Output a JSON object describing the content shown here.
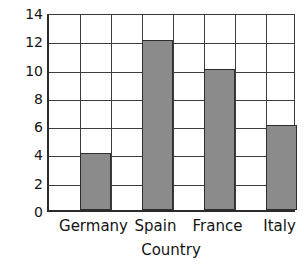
{
  "chart_data": {
    "type": "bar",
    "title": "",
    "categories": [
      "Germany",
      "Spain",
      "France",
      "Italy"
    ],
    "values": [
      4,
      12,
      10,
      6
    ],
    "xlabel": "Country",
    "ylabel": "Number of adults",
    "ylim": [
      0,
      14
    ],
    "ytick_labels": [
      "0",
      "2",
      "4",
      "6",
      "8",
      "10",
      "12",
      "14"
    ],
    "ytick_values": [
      0,
      2,
      4,
      6,
      8,
      10,
      12,
      14
    ],
    "grid": true,
    "grid_columns": 8,
    "legend": "none",
    "bar_color": "#8b8b8b",
    "bar_edge_color": "#2e2e2e",
    "axis_color": "#2b2b2b",
    "grid_color": "#3d3d3d",
    "background_color": "#ffffff"
  }
}
